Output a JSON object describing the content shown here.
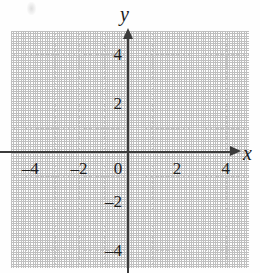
{
  "chart_data": {
    "type": "scatter",
    "title": "",
    "xlabel": "x",
    "ylabel": "y",
    "xlim": [
      -4.8,
      4.9
    ],
    "ylim": [
      -4.7,
      4.8
    ],
    "grid": true,
    "legend": null,
    "series": [],
    "x": [],
    "y": [],
    "x_ticks": [
      {
        "value": -4,
        "label": "–4"
      },
      {
        "value": -2,
        "label": "–2"
      },
      {
        "value": 0,
        "label": "0"
      },
      {
        "value": 2,
        "label": "2"
      },
      {
        "value": 4,
        "label": "4"
      }
    ],
    "y_ticks": [
      {
        "value": 4,
        "label": "4"
      },
      {
        "value": 2,
        "label": "2"
      },
      {
        "value": -2,
        "label": "–2"
      },
      {
        "value": -4,
        "label": "–4"
      }
    ],
    "minor_step": 1,
    "major_label_step": 2,
    "annotations": []
  },
  "axes": {
    "x_name": "x",
    "y_name": "y"
  },
  "colors": {
    "background": "#fefefe",
    "grid": "#c6c6c6",
    "axis": "#3b3b3b",
    "label": "#1c1c1c"
  }
}
